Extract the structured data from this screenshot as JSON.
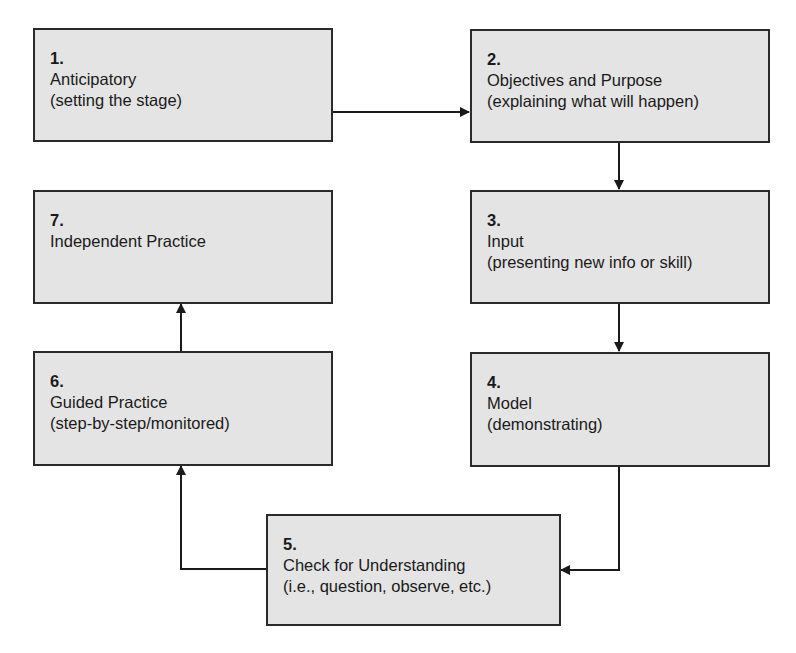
{
  "diagram": {
    "type": "flowchart",
    "steps": [
      {
        "number": "1.",
        "title": "Anticipatory",
        "desc": "(setting the stage)"
      },
      {
        "number": "2.",
        "title": "Objectives and Purpose",
        "desc": "(explaining what will happen)"
      },
      {
        "number": "3.",
        "title": "Input",
        "desc": "(presenting new info or skill)"
      },
      {
        "number": "4.",
        "title": "Model",
        "desc": "(demonstrating)"
      },
      {
        "number": "5.",
        "title": "Check for Understanding",
        "desc": "(i.e., question, observe, etc.)"
      },
      {
        "number": "6.",
        "title": "Guided Practice",
        "desc": "(step-by-step/monitored)"
      },
      {
        "number": "7.",
        "title": "Independent Practice",
        "desc": ""
      }
    ],
    "connections": [
      {
        "from": "1",
        "to": "2"
      },
      {
        "from": "2",
        "to": "3"
      },
      {
        "from": "3",
        "to": "4"
      },
      {
        "from": "4",
        "to": "5"
      },
      {
        "from": "5",
        "to": "6"
      },
      {
        "from": "6",
        "to": "7"
      }
    ],
    "colors": {
      "box_fill": "#e4e4e4",
      "border": "#2a2a2a",
      "arrow": "#1a1a1a",
      "background": "#ffffff"
    }
  }
}
